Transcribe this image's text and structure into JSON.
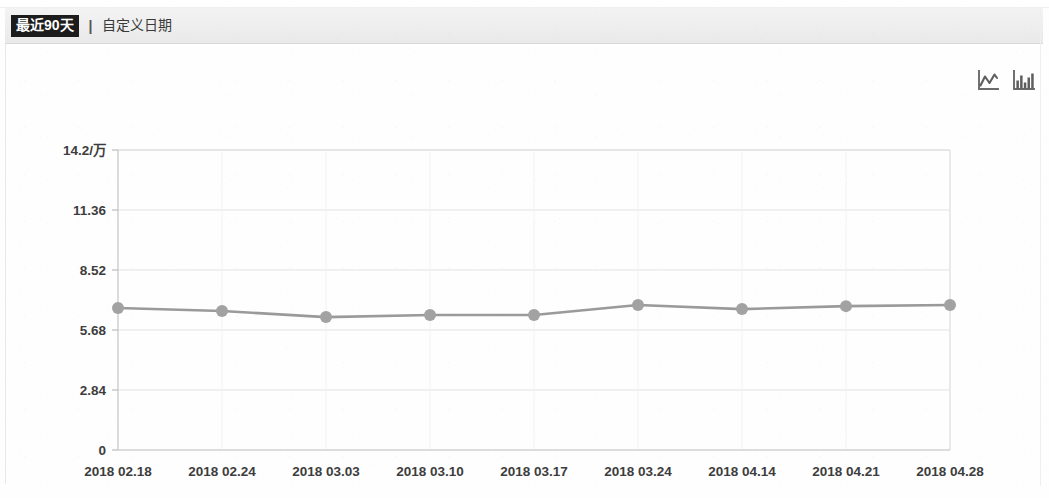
{
  "header": {
    "selected_range_label": "最近90天",
    "divider": "|",
    "custom_date_label": "自定义日期"
  },
  "toolbar": {
    "line_chart_icon": "line-chart-icon",
    "bar_chart_icon": "bar-chart-icon"
  },
  "chart_data": {
    "type": "line",
    "title": "",
    "xlabel": "",
    "ylabel": "",
    "unit_label": "/万",
    "ylim": [
      0,
      14.2
    ],
    "grid": true,
    "legend": "none",
    "y_ticks": [
      "0",
      "2.84",
      "5.68",
      "8.52",
      "11.36",
      "14.2/万"
    ],
    "y_tick_values": [
      0,
      2.84,
      5.68,
      8.52,
      11.36,
      14.2
    ],
    "categories": [
      "2018 02.18",
      "2018 02.24",
      "2018 03.03",
      "2018 03.10",
      "2018 03.17",
      "2018 03.24",
      "2018 04.14",
      "2018 04.21",
      "2018 04.28"
    ],
    "series": [
      {
        "name": "",
        "color": "#9a9a9a",
        "values": [
          6.72,
          6.58,
          6.29,
          6.39,
          6.39,
          6.86,
          6.67,
          6.81,
          6.86
        ]
      }
    ]
  },
  "colors": {
    "line": "#9a9a9a",
    "dot": "#a2a2a2",
    "grid": "#e3e3e3",
    "axis": "#c9c9c9",
    "header_bg": "#eeeeee",
    "tab_selected_bg": "#1c1c1c",
    "tab_selected_fg": "#ffffff",
    "text": "#3d3d3d"
  }
}
